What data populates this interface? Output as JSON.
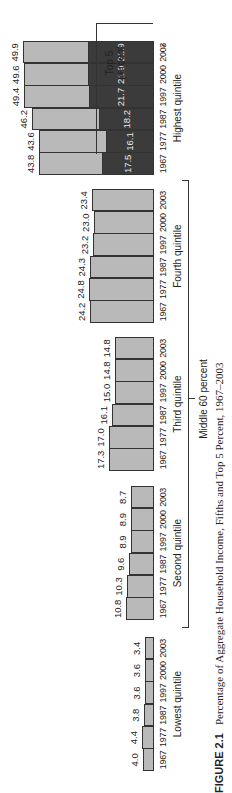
{
  "chart_data": {
    "type": "bar",
    "orientation": "rotated 90° counter-clockwise on page",
    "categories": [
      "1967",
      "1977",
      "1987",
      "1997",
      "2000",
      "2003"
    ],
    "groups": [
      {
        "name": "Lowest quintile",
        "values": [
          4.0,
          4.4,
          3.8,
          3.6,
          3.6,
          3.4
        ]
      },
      {
        "name": "Second quintile",
        "values": [
          10.8,
          10.3,
          9.6,
          8.9,
          8.9,
          8.7
        ]
      },
      {
        "name": "Third quintile",
        "values": [
          17.3,
          17.0,
          16.1,
          15.0,
          14.8,
          14.8
        ]
      },
      {
        "name": "Fourth quintile",
        "values": [
          24.2,
          24.8,
          24.3,
          23.2,
          23.0,
          23.4
        ]
      },
      {
        "name": "Highest quintile",
        "values": [
          43.8,
          43.6,
          46.2,
          49.4,
          49.6,
          49.9
        ],
        "subseries": {
          "name": "Top 5 percent",
          "values": [
            17.5,
            16.1,
            18.2,
            21.7,
            21.9,
            21.9
          ]
        }
      }
    ],
    "brackets": [
      {
        "label": "Middle 60 percent",
        "spans": [
          "Second quintile",
          "Third quintile",
          "Fourth quintile"
        ]
      },
      {
        "label": "Top 5 percent",
        "spans": [
          "Highest quintile (dark segment)"
        ]
      }
    ],
    "footnote_marker": "*",
    "xlabel": "",
    "ylabel": "",
    "grid": false,
    "colors": {
      "quintile": "#b9b9b9",
      "top5": "#3b3b3b"
    }
  },
  "labels": {
    "caption_figure": "FIGURE 2.1",
    "caption_text": "Percentage of Aggregate Household Income, Fifths and Top 5 Percent, 1967–2003",
    "middle60": "Middle 60 percent",
    "top5_line1": "Top 5",
    "top5_line2": "percent",
    "asterisk": "*"
  }
}
